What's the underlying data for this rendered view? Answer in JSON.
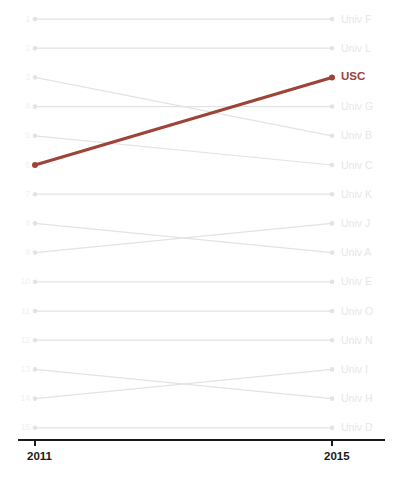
{
  "chart_data": {
    "type": "line",
    "subtype": "bump-chart",
    "title": "",
    "xlabel": "",
    "ylabel": "",
    "x": [
      "2011",
      "2015"
    ],
    "categories": [
      "2011",
      "2015"
    ],
    "tick_labels": {
      "x": [
        "2011",
        "2015"
      ],
      "y": [
        "1",
        "2",
        "3",
        "4",
        "5",
        "6",
        "7",
        "8",
        "9",
        "10",
        "11",
        "12",
        "13",
        "14",
        "15"
      ]
    },
    "ylim": [
      1,
      15
    ],
    "y_axis_inverted": true,
    "grid": false,
    "legend": "right-of-last-point",
    "highlight_series": "USC",
    "highlight_color": "#9e4338",
    "muted_color": "#e3e3e3",
    "series": [
      {
        "name": "Univ F",
        "values": [
          1,
          1
        ],
        "highlight": false
      },
      {
        "name": "Univ L",
        "values": [
          2,
          2
        ],
        "highlight": false
      },
      {
        "name": "Univ B",
        "values": [
          3,
          5
        ],
        "highlight": false
      },
      {
        "name": "Univ G",
        "values": [
          4,
          4
        ],
        "highlight": false
      },
      {
        "name": "Univ C",
        "values": [
          5,
          6
        ],
        "highlight": false
      },
      {
        "name": "USC",
        "values": [
          6,
          3
        ],
        "highlight": true
      },
      {
        "name": "Univ K",
        "values": [
          7,
          7
        ],
        "highlight": false
      },
      {
        "name": "Univ J",
        "values": [
          9,
          8
        ],
        "highlight": false
      },
      {
        "name": "Univ A",
        "values": [
          8,
          9
        ],
        "highlight": false
      },
      {
        "name": "Univ E",
        "values": [
          10,
          10
        ],
        "highlight": false
      },
      {
        "name": "Univ O",
        "values": [
          11,
          11
        ],
        "highlight": false
      },
      {
        "name": "Univ N",
        "values": [
          12,
          12
        ],
        "highlight": false
      },
      {
        "name": "Univ I",
        "values": [
          14,
          13
        ],
        "highlight": false
      },
      {
        "name": "Univ H",
        "values": [
          13,
          14
        ],
        "highlight": false
      },
      {
        "name": "Univ D",
        "values": [
          15,
          15
        ],
        "highlight": false
      }
    ],
    "right_labels_top_to_bottom": [
      "Univ F",
      "Univ L",
      "USC",
      "Univ G",
      "Univ B",
      "Univ C",
      "Univ K",
      "Univ A",
      "Univ J",
      "Univ E",
      "Univ O",
      "Univ N",
      "Univ H",
      "Univ I",
      "Univ D"
    ]
  },
  "axis": {
    "x_start_label": "2011",
    "x_end_label": "2015",
    "axis_color": "#1a1a1a"
  },
  "geometry": {
    "x_left": 35,
    "x_right": 332,
    "y_first": 19,
    "y_step": 29.2,
    "axis_y": 440
  }
}
